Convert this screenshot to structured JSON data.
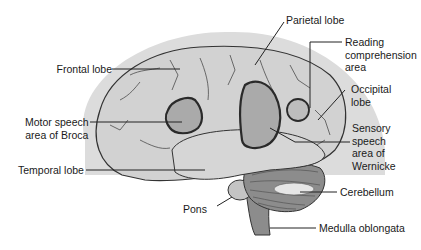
{
  "figure": {
    "colors": {
      "background": "#ffffff",
      "halo": "#dcdcdc",
      "cerebrum_fill": "#d2d2d2",
      "speech_area_fill": "#aaaaaa",
      "temporal_fill": "#d6d6d6",
      "cerebellum_fill": "#8c8c8c",
      "outline": "#333333",
      "area_outline": "#2a2a2a",
      "leader_line": "#222222",
      "text": "#1a1a1a"
    }
  },
  "labels": {
    "frontal_lobe": "Frontal lobe",
    "parietal_lobe": "Parietal lobe",
    "reading_area": [
      "Reading",
      "comprehension",
      "area"
    ],
    "occipital_lobe": [
      "Occipital",
      "lobe"
    ],
    "broca": [
      "Motor speech",
      "area of Broca"
    ],
    "wernicke": [
      "Sensory",
      "speech",
      "area of",
      "Wernicke"
    ],
    "temporal_lobe": "Temporal lobe",
    "cerebellum": "Cerebellum",
    "pons": "Pons",
    "medulla": "Medulla oblongata"
  }
}
